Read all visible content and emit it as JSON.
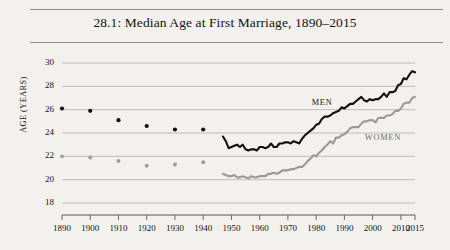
{
  "figure": {
    "title": "28.1: Median Age at First Marriage, 1890–2015",
    "background_color": "#f2f1ee"
  },
  "axes": {
    "y_axis_title": "AGE (YEARS)",
    "y_ticks": [
      "18",
      "20",
      "22",
      "24",
      "26",
      "28",
      "30"
    ],
    "x_ticks": [
      "1890",
      "1900",
      "1910",
      "1920",
      "1930",
      "1940",
      "1950",
      "1960",
      "1970",
      "1980",
      "1990",
      "2000",
      "2010",
      "2015"
    ]
  },
  "series_labels": {
    "men": "MEN",
    "women": "WOMEN"
  },
  "chart_data": {
    "type": "line",
    "title": "28.1: Median Age at First Marriage, 1890–2015",
    "xlabel": "",
    "ylabel": "AGE (YEARS)",
    "xlim": [
      1890,
      2015
    ],
    "ylim": [
      18,
      30
    ],
    "y_ticks": [
      18,
      20,
      22,
      24,
      26,
      28,
      30
    ],
    "x_ticks": [
      1890,
      1900,
      1910,
      1920,
      1930,
      1940,
      1950,
      1960,
      1970,
      1980,
      1990,
      2000,
      2010,
      2015
    ],
    "grid": "horizontal",
    "legend": "inline-annotations",
    "colors": {
      "men": "#111111",
      "women": "#9a9a9a",
      "grid": "#b9b7b2",
      "axis": "#5a5a5a"
    },
    "annotations": [
      {
        "text": "MEN",
        "x": 1983,
        "y": 26.6
      },
      {
        "text": "WOMEN",
        "x": 2005,
        "y": 23.6
      }
    ],
    "series": [
      {
        "name": "MEN",
        "color": "#111111",
        "marker_points": {
          "x": [
            1890,
            1900,
            1910,
            1920,
            1930,
            1940
          ],
          "y": [
            26.1,
            25.9,
            25.1,
            24.6,
            24.3,
            24.3
          ]
        },
        "line_points": {
          "x": [
            1947,
            1948,
            1949,
            1950,
            1951,
            1952,
            1953,
            1954,
            1955,
            1956,
            1957,
            1958,
            1959,
            1960,
            1961,
            1962,
            1963,
            1964,
            1965,
            1966,
            1967,
            1968,
            1969,
            1970,
            1971,
            1972,
            1973,
            1974,
            1975,
            1976,
            1977,
            1978,
            1979,
            1980,
            1981,
            1982,
            1983,
            1984,
            1985,
            1986,
            1987,
            1988,
            1989,
            1990,
            1991,
            1992,
            1993,
            1994,
            1995,
            1996,
            1997,
            1998,
            1999,
            2000,
            2001,
            2002,
            2003,
            2004,
            2005,
            2006,
            2007,
            2008,
            2009,
            2010,
            2011,
            2012,
            2013,
            2014,
            2015
          ],
          "y": [
            23.7,
            23.3,
            22.7,
            22.8,
            22.9,
            23.0,
            22.8,
            23.0,
            22.6,
            22.5,
            22.6,
            22.6,
            22.5,
            22.8,
            22.8,
            22.7,
            22.8,
            23.1,
            22.8,
            22.8,
            23.1,
            23.1,
            23.2,
            23.2,
            23.1,
            23.3,
            23.2,
            23.1,
            23.5,
            23.8,
            24.0,
            24.2,
            24.4,
            24.7,
            24.8,
            25.2,
            25.4,
            25.4,
            25.5,
            25.7,
            25.8,
            25.9,
            26.2,
            26.1,
            26.3,
            26.5,
            26.5,
            26.7,
            26.9,
            27.1,
            26.8,
            26.7,
            26.9,
            26.8,
            26.9,
            26.9,
            27.1,
            27.4,
            27.1,
            27.5,
            27.5,
            27.6,
            28.1,
            28.2,
            28.7,
            28.6,
            29.0,
            29.3,
            29.2
          ]
        }
      },
      {
        "name": "WOMEN",
        "color": "#9a9a9a",
        "marker_points": {
          "x": [
            1890,
            1900,
            1910,
            1920,
            1930,
            1940
          ],
          "y": [
            22.0,
            21.9,
            21.6,
            21.2,
            21.3,
            21.5
          ]
        },
        "line_points": {
          "x": [
            1947,
            1948,
            1949,
            1950,
            1951,
            1952,
            1953,
            1954,
            1955,
            1956,
            1957,
            1958,
            1959,
            1960,
            1961,
            1962,
            1963,
            1964,
            1965,
            1966,
            1967,
            1968,
            1969,
            1970,
            1971,
            1972,
            1973,
            1974,
            1975,
            1976,
            1977,
            1978,
            1979,
            1980,
            1981,
            1982,
            1983,
            1984,
            1985,
            1986,
            1987,
            1988,
            1989,
            1990,
            1991,
            1992,
            1993,
            1994,
            1995,
            1996,
            1997,
            1998,
            1999,
            2000,
            2001,
            2002,
            2003,
            2004,
            2005,
            2006,
            2007,
            2008,
            2009,
            2010,
            2011,
            2012,
            2013,
            2014,
            2015
          ],
          "y": [
            20.5,
            20.4,
            20.3,
            20.3,
            20.4,
            20.2,
            20.2,
            20.3,
            20.2,
            20.1,
            20.3,
            20.2,
            20.2,
            20.3,
            20.3,
            20.3,
            20.5,
            20.5,
            20.6,
            20.5,
            20.6,
            20.8,
            20.8,
            20.8,
            20.9,
            20.9,
            21.0,
            21.1,
            21.1,
            21.3,
            21.6,
            21.8,
            22.1,
            22.0,
            22.3,
            22.5,
            22.8,
            23.0,
            23.3,
            23.1,
            23.6,
            23.6,
            23.8,
            23.9,
            24.1,
            24.4,
            24.5,
            24.5,
            24.5,
            24.8,
            25.0,
            25.0,
            25.1,
            25.1,
            24.9,
            25.3,
            25.3,
            25.3,
            25.5,
            25.5,
            25.6,
            25.9,
            25.9,
            26.1,
            26.5,
            26.6,
            26.6,
            27.0,
            27.1
          ]
        }
      }
    ]
  }
}
